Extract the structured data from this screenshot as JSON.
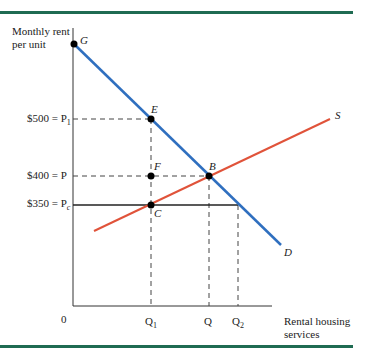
{
  "axes": {
    "y_label_line1": "Monthly rent",
    "y_label_line2": "per unit",
    "x_label_line1": "Rental housing",
    "x_label_line2": "services",
    "origin": "0"
  },
  "price_labels": {
    "p1": "$500 = P",
    "p1_sub": "1",
    "p": "$400 = P",
    "pc": "$350 = P",
    "pc_sub": "c"
  },
  "quantity_labels": {
    "q1": "Q",
    "q1_sub": "1",
    "q": "Q",
    "q2": "Q",
    "q2_sub": "2"
  },
  "points": {
    "g": "G",
    "e": "E",
    "f": "F",
    "b": "B",
    "c": "C"
  },
  "curves": {
    "supply": "S",
    "demand": "D"
  },
  "colors": {
    "demand": "#2f6fbf",
    "supply": "#e0533a",
    "rule": "#1f6b52",
    "axis": "#333333"
  }
}
